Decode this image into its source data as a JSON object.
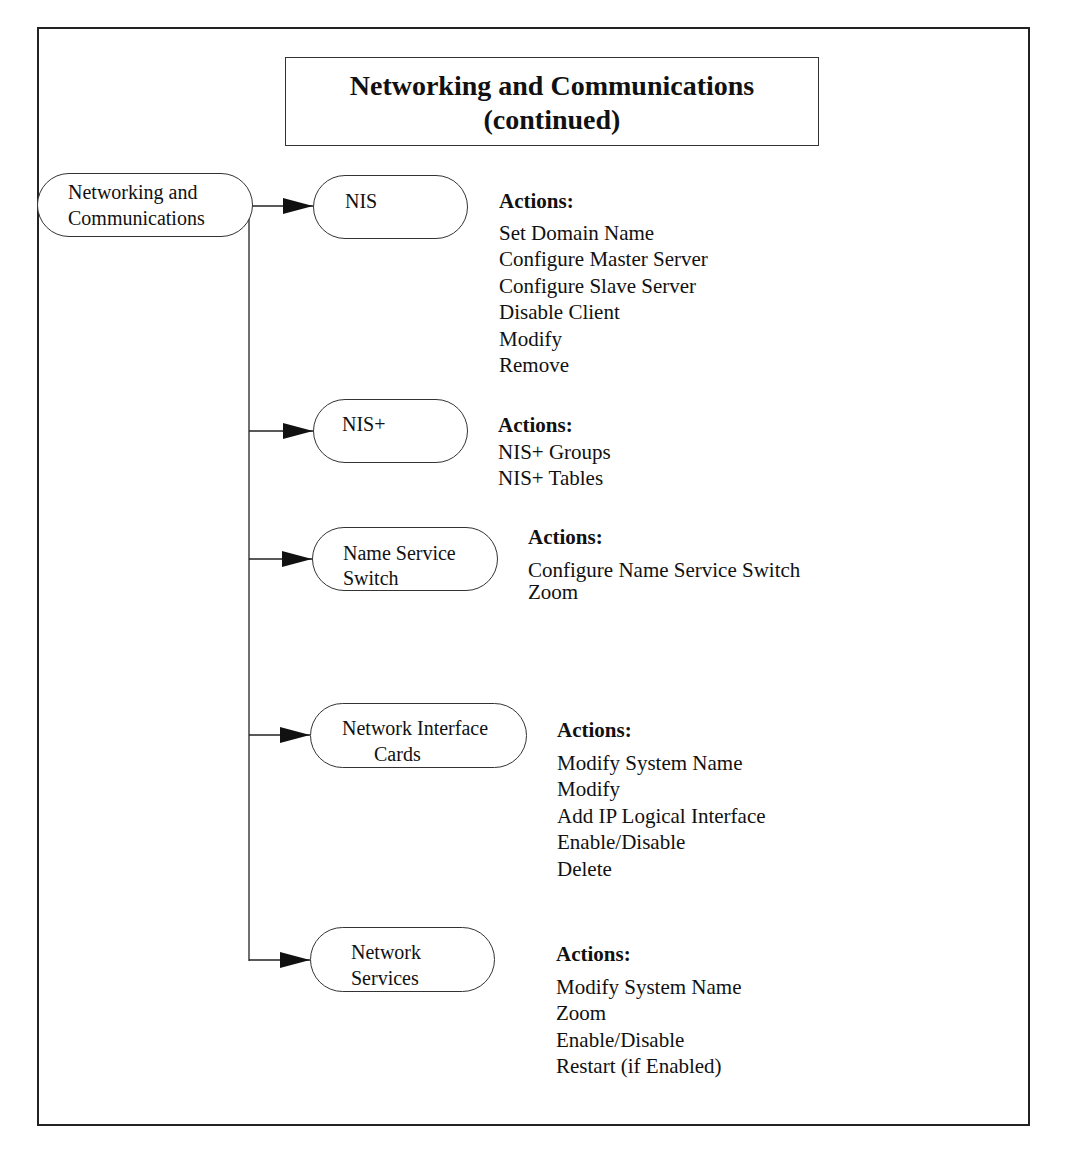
{
  "title": {
    "line1": "Networking and Communications",
    "line2": "(continued)"
  },
  "root": {
    "line1": "Networking and",
    "line2": "Communications"
  },
  "actions_label": "Actions:",
  "nodes": [
    {
      "line1": "NIS",
      "line2": "",
      "actions": [
        "Set Domain Name",
        "Configure Master Server",
        "Configure Slave Server",
        "Disable Client",
        "Modify",
        "Remove"
      ]
    },
    {
      "line1": "NIS+",
      "line2": "",
      "actions": [
        "NIS+ Groups",
        "NIS+ Tables"
      ]
    },
    {
      "line1": "Name Service",
      "line2": "Switch",
      "actions": [
        "Configure Name Service Switch",
        "Zoom"
      ]
    },
    {
      "line1": "Network Interface",
      "line2": "Cards",
      "actions": [
        "Modify System Name",
        "Modify",
        "Add IP Logical Interface",
        "Enable/Disable",
        "Delete"
      ]
    },
    {
      "line1": "Network",
      "line2": "Services",
      "actions": [
        "Modify System Name",
        "Zoom",
        "Enable/Disable",
        "Restart (if Enabled)"
      ]
    }
  ]
}
